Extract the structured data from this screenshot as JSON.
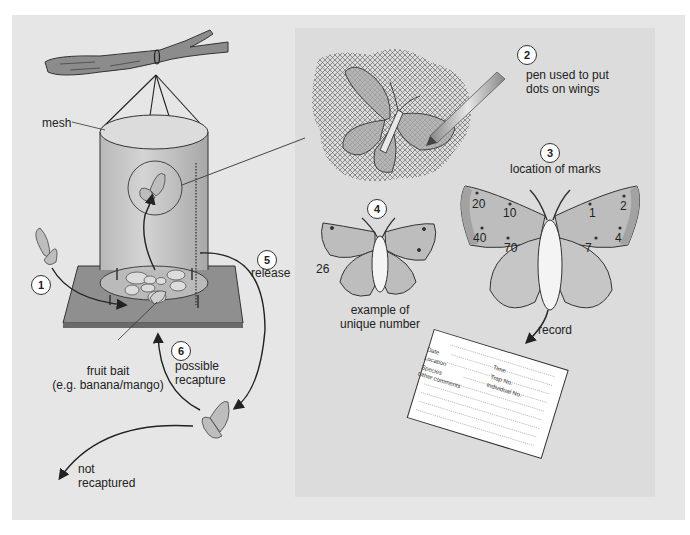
{
  "diagram": {
    "colors": {
      "background": "#e6e6e6",
      "panel": "#dcdcdc",
      "wing": "#bdbdbd",
      "wing_edge": "#a2a2a2",
      "line": "#222222",
      "card": "#ffffff"
    },
    "labels": {
      "mesh": "mesh",
      "fruit_bait_line1": "fruit bait",
      "fruit_bait_line2": "(e.g. banana/mango)",
      "release": "release",
      "possible_recapture_line1": "possible",
      "possible_recapture_line2": "recapture",
      "not_recaptured_line1": "not",
      "not_recaptured_line2": "recaptured",
      "pen_line1": "pen used to put",
      "pen_line2": "dots on wings",
      "location_of_marks": "location of marks",
      "example_line1": "example of",
      "example_line2": "unique number",
      "example_number": "26",
      "record": "record"
    },
    "steps": [
      {
        "number": "1",
        "meaning": "butterfly enters trap"
      },
      {
        "number": "2",
        "meaning": "pen used to put dots on wings"
      },
      {
        "number": "3",
        "meaning": "location of marks"
      },
      {
        "number": "4",
        "meaning": "example of unique number"
      },
      {
        "number": "5",
        "meaning": "release"
      },
      {
        "number": "6",
        "meaning": "possible recapture"
      }
    ],
    "wing_marks": {
      "left_forewing": [
        "20",
        "10",
        "40",
        "70"
      ],
      "right_forewing": [
        "1",
        "2",
        "4",
        "7"
      ]
    },
    "record_card": {
      "fields": [
        {
          "label": "Date"
        },
        {
          "label": "Time"
        },
        {
          "label": "Location"
        },
        {
          "label": "Trap No."
        },
        {
          "label": "Species"
        },
        {
          "label": "Individual No."
        },
        {
          "label": "Other comments"
        }
      ]
    }
  }
}
